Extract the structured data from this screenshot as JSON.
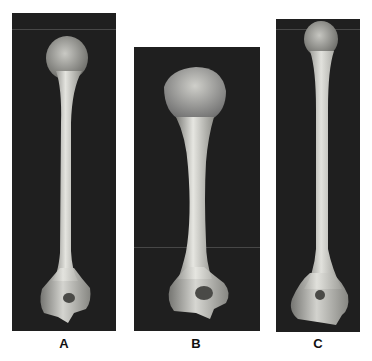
{
  "figure": {
    "panels": [
      {
        "id": "A",
        "label": "A",
        "subject": "humerus bone, anterior view"
      },
      {
        "id": "B",
        "label": "B",
        "subject": "humerus bone, anterior view"
      },
      {
        "id": "C",
        "label": "C",
        "subject": "humerus bone, anterior view"
      }
    ],
    "colors": {
      "panel_background": "#1f1f1f",
      "bone": "#d9d9d4",
      "bone_shadow": "#8a8a86"
    }
  }
}
